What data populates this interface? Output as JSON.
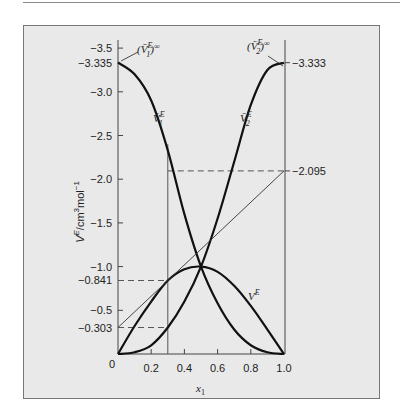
{
  "chart_data": {
    "type": "line",
    "title": "",
    "xlabel": "x1",
    "ylabel": "V^E/cm^3 mol^-1",
    "xlim": [
      0,
      1.0
    ],
    "ylim": [
      0,
      3.5
    ],
    "y_axis_note": "values shown with negative sign (axis labeled -0.5 ... -3.5, increasing magnitude upward)",
    "x_ticks": [
      "0",
      "0.2",
      "0.4",
      "0.6",
      "0.8",
      "1.0"
    ],
    "y_ticks": [
      "-0.5",
      "-1.0",
      "-1.5",
      "-2.0",
      "-2.5",
      "-3.0",
      "-3.5"
    ],
    "special_y_labels_left": [
      "-3.335",
      "-0.841",
      "-0.303"
    ],
    "special_y_labels_right": [
      "-3.333",
      "-2.095"
    ],
    "grid": false,
    "legend": null,
    "series": [
      {
        "name": "V̄1^E",
        "x": [
          0,
          0.1,
          0.2,
          0.3,
          0.4,
          0.5,
          0.6,
          0.7,
          0.8,
          0.9,
          1.0
        ],
        "values": [
          3.335,
          3.2,
          2.9,
          2.33,
          1.6,
          1.0,
          0.58,
          0.28,
          0.1,
          0.02,
          0
        ]
      },
      {
        "name": "V̄2^E",
        "x": [
          0,
          0.1,
          0.2,
          0.3,
          0.4,
          0.5,
          0.6,
          0.7,
          0.8,
          0.9,
          1.0
        ],
        "values": [
          0,
          0.02,
          0.1,
          0.303,
          0.6,
          1.0,
          1.55,
          2.2,
          2.85,
          3.25,
          3.333
        ]
      },
      {
        "name": "V^E",
        "x": [
          0,
          0.1,
          0.2,
          0.3,
          0.4,
          0.5,
          0.6,
          0.7,
          0.8,
          0.9,
          1.0
        ],
        "values": [
          0,
          0.32,
          0.6,
          0.841,
          0.97,
          1.0,
          0.94,
          0.78,
          0.55,
          0.28,
          0
        ]
      },
      {
        "name": "tangent at x1=0.3",
        "x": [
          0,
          1.0
        ],
        "values": [
          0.303,
          2.095
        ]
      }
    ],
    "annotations": [
      {
        "text": "(V̄1^E)^∞",
        "value": -3.335,
        "at_x": 0
      },
      {
        "text": "(V̄2^E)^∞",
        "value": -3.333,
        "at_x": 1.0
      },
      {
        "text": "V̄1^E",
        "type": "curve-label"
      },
      {
        "text": "V̄2^E",
        "type": "curve-label"
      },
      {
        "text": "V^E",
        "type": "curve-label"
      }
    ],
    "reference_lines": [
      {
        "type": "vertical",
        "x": 0.3,
        "from": 0,
        "to": 2.4
      },
      {
        "type": "dashed-horizontal",
        "y": 0.841,
        "x_from": 0,
        "x_to": 0.3
      },
      {
        "type": "dashed-horizontal",
        "y": 0.303,
        "x_from": 0,
        "x_to": 0.3
      },
      {
        "type": "dashed-horizontal",
        "y": 2.095,
        "x_from": 0.3,
        "x_to": 1.0
      }
    ]
  },
  "labels": {
    "inf1_base": "(V̄",
    "inf1_sub": "1",
    "inf2_sub": "2",
    "sup_E": "E",
    "inf_sup": "∞",
    "v1_label_base": "V̄",
    "v2_label_base": "V̄",
    "ve_label_base": "V",
    "x_axis_base": "x",
    "x_axis_sub": "1",
    "y_axis_title": "V",
    "y_axis_rest": "/cm",
    "y_axis_3": "3",
    "y_axis_mol": "mol",
    "y_axis_m1": "−1",
    "right_top": "−3.333",
    "right_mid": "2.095",
    "left_top_special": "−3.335",
    "left_841": "−0.841",
    "left_303": "−0.303",
    "origin": "0"
  },
  "colors": {
    "background": "#ffffff",
    "panel": "#e9e9e9",
    "ink": "#111111",
    "thin": "#555555"
  }
}
